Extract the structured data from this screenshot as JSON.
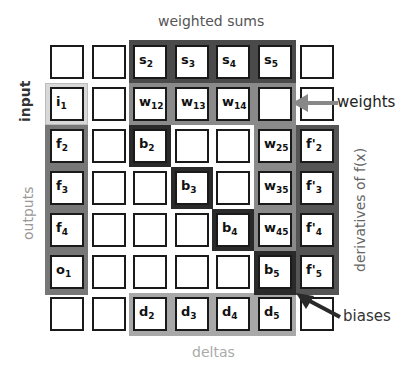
{
  "captions": {
    "top": "weighted sums",
    "bottom": "deltas",
    "left_input": "input",
    "left_outputs": "outputs",
    "right_derivatives": "derivatives of f(x)",
    "weights_arrow": "weights",
    "biases_arrow": "biases"
  },
  "colors": {
    "weighted_sums": "#4a4a4a",
    "weights": "#8a8a8a",
    "biases": "#2a2a2a",
    "outputs": "#7a7a7a",
    "input": "#d8d8d8",
    "derivatives": "#555555",
    "deltas": "#a8a8a8"
  },
  "grid": {
    "rows": 7,
    "cols": 7,
    "cells": [
      [
        "",
        "",
        "s|2",
        "s|3",
        "s|4",
        "s|5",
        ""
      ],
      [
        "i|1",
        "",
        "w|12",
        "w|13",
        "w|14",
        "",
        ""
      ],
      [
        "f|2",
        "",
        "b|2",
        "",
        "",
        "w|25",
        "f'|2"
      ],
      [
        "f|3",
        "",
        "",
        "b|3",
        "",
        "w|35",
        "f'|3"
      ],
      [
        "f|4",
        "",
        "",
        "",
        "b|4",
        "w|45",
        "f'|4"
      ],
      [
        "o|1",
        "",
        "",
        "",
        "",
        "b|5",
        "f'|5"
      ],
      [
        "",
        "",
        "d|2",
        "d|3",
        "d|4",
        "d|5",
        ""
      ]
    ]
  }
}
